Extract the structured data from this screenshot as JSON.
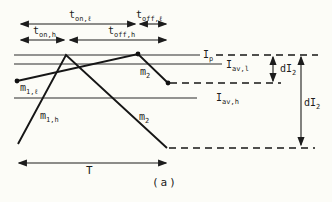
{
  "figure": {
    "caption": "(a)",
    "bg_color": "#fcfcf7",
    "ink_color": "#1c1c1c"
  },
  "timing_labels": {
    "on_light": {
      "base": "t",
      "sub": "on,ℓ"
    },
    "off_light": {
      "base": "t",
      "sub": "off,ℓ"
    },
    "on_heavy": {
      "base": "t",
      "sub": "on,h"
    },
    "off_heavy": {
      "base": "t",
      "sub": "off,h"
    },
    "period": "T"
  },
  "current_levels": {
    "peak": {
      "base": "I",
      "sub": "p"
    },
    "average_light": {
      "base": "I",
      "sub": "av,l"
    },
    "average_heavy": {
      "base": "I",
      "sub": "av,h"
    }
  },
  "slope_labels": {
    "rise_light": {
      "base": "m",
      "sub": "1,ℓ"
    },
    "rise_heavy": {
      "base": "m",
      "sub": "1,h"
    },
    "fall_light": {
      "base": "m",
      "sub": "2"
    },
    "fall_heavy": {
      "base": "m",
      "sub": "2"
    }
  },
  "ripple_labels": {
    "light_ripple": {
      "base": "dI",
      "sub": "2"
    },
    "heavy_ripple": {
      "base": "dI",
      "sub": "2"
    }
  }
}
